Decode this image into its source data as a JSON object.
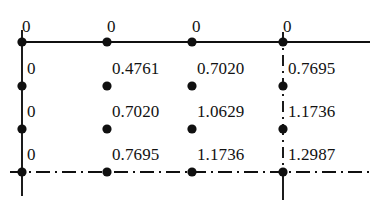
{
  "figure": {
    "kind": "grid-node-value-diagram"
  },
  "chart_data": {
    "type": "table",
    "title": "",
    "xlabel": "",
    "ylabel": "",
    "grid": true,
    "rows": 4,
    "cols": 4,
    "values": [
      [
        "0",
        "0",
        "0",
        "0"
      ],
      [
        "0",
        "0.4761",
        "0.7020",
        "0.7695"
      ],
      [
        "0",
        "0.7020",
        "1.0629",
        "1.1736"
      ],
      [
        "0",
        "0.7695",
        "1.1736",
        "1.2987"
      ]
    ]
  },
  "nodes": [
    {
      "id": "n-r0-c0",
      "value": "0",
      "x": 22,
      "y": 42,
      "lx": 22,
      "ly": 18,
      "align": "left"
    },
    {
      "id": "n-r0-c1",
      "value": "0",
      "x": 107,
      "y": 42,
      "lx": 107,
      "ly": 18,
      "align": "left"
    },
    {
      "id": "n-r0-c2",
      "value": "0",
      "x": 192,
      "y": 42,
      "lx": 192,
      "ly": 18,
      "align": "left"
    },
    {
      "id": "n-r0-c3",
      "value": "0",
      "x": 283,
      "y": 42,
      "lx": 283,
      "ly": 18,
      "align": "left"
    },
    {
      "id": "n-r1-c0",
      "value": "0",
      "x": 22,
      "y": 86,
      "lx": 27,
      "ly": 60,
      "align": "left"
    },
    {
      "id": "n-r1-c1",
      "value": "0.4761",
      "x": 107,
      "y": 86,
      "lx": 112,
      "ly": 60,
      "align": "left"
    },
    {
      "id": "n-r1-c2",
      "value": "0.7020",
      "x": 192,
      "y": 86,
      "lx": 197,
      "ly": 60,
      "align": "left"
    },
    {
      "id": "n-r1-c3",
      "value": "0.7695",
      "x": 283,
      "y": 86,
      "lx": 288,
      "ly": 60,
      "align": "left"
    },
    {
      "id": "n-r2-c0",
      "value": "0",
      "x": 22,
      "y": 129,
      "lx": 27,
      "ly": 103,
      "align": "left"
    },
    {
      "id": "n-r2-c1",
      "value": "0.7020",
      "x": 107,
      "y": 129,
      "lx": 112,
      "ly": 103,
      "align": "left"
    },
    {
      "id": "n-r2-c2",
      "value": "1.0629",
      "x": 192,
      "y": 129,
      "lx": 197,
      "ly": 103,
      "align": "left"
    },
    {
      "id": "n-r2-c3",
      "value": "1.1736",
      "x": 283,
      "y": 129,
      "lx": 288,
      "ly": 103,
      "align": "left"
    },
    {
      "id": "n-r3-c0",
      "value": "0",
      "x": 22,
      "y": 172,
      "lx": 27,
      "ly": 146,
      "align": "left"
    },
    {
      "id": "n-r3-c1",
      "value": "0.7695",
      "x": 107,
      "y": 172,
      "lx": 112,
      "ly": 146,
      "align": "left"
    },
    {
      "id": "n-r3-c2",
      "value": "1.1736",
      "x": 192,
      "y": 172,
      "lx": 197,
      "ly": 146,
      "align": "left"
    },
    {
      "id": "n-r3-c3",
      "value": "1.2987",
      "x": 283,
      "y": 172,
      "lx": 288,
      "ly": 146,
      "align": "left"
    }
  ],
  "geometry": {
    "colX": [
      22,
      107,
      192,
      283
    ],
    "rowY": [
      42,
      86,
      129,
      172
    ],
    "topLineX": [
      22,
      370
    ],
    "bottomLineX": [
      10,
      370
    ],
    "leftLineY": [
      30,
      196
    ],
    "rightLineY": [
      32,
      200
    ],
    "dotRadius": 4.6,
    "strokeWidth": 1.9
  },
  "colors": {
    "ink": "#101010",
    "background": "#ffffff"
  }
}
